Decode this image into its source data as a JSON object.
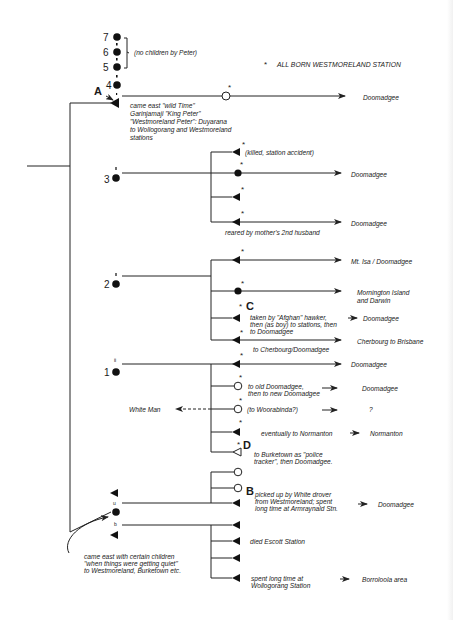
{
  "legend": {
    "symbol": "*",
    "text": "ALL BORN WESTMORELAND STATION"
  },
  "top_wives": {
    "numbers": [
      "7",
      "6",
      "5",
      "4"
    ],
    "bracket_note": "(no children  by Peter)"
  },
  "man_a": {
    "marker": "A",
    "note_lines": [
      "came east \"wild Time\"",
      "Garinjamaji  \"King Peter\"",
      "\"Westmoreland Peter\": Duyarana",
      "to Wollogorang and Westmoreland",
      "stations"
    ],
    "child": {
      "star": "*",
      "destination": "Doomadgee"
    }
  },
  "wife_3": {
    "number": "3",
    "children": [
      {
        "note": "(killed, station accident)",
        "star": "*"
      },
      {
        "destination": "Doomadgee",
        "star": "*"
      },
      {
        "star": "*"
      },
      {
        "destination": "Doomadgee",
        "star": "*",
        "note": "reared by mother's 2nd husband"
      }
    ]
  },
  "wife_2": {
    "number": "2",
    "children": [
      {
        "destination": "Mt. Isa / Doomadgee",
        "star": "*"
      },
      {
        "destination_lines": [
          "Mornington Island",
          "and Darwin"
        ],
        "star": "*"
      },
      {
        "marker": "C",
        "star": "*",
        "note_lines": [
          "taken by \"Afghan\" hawker,",
          "then (as boy) to stations, then",
          "to Doomadgee"
        ],
        "destination": "Doomadgee"
      },
      {
        "destination": "Cherbourg to Brisbane",
        "star": "*",
        "note": "to Cherbourg/Doomadgee"
      }
    ]
  },
  "wife_1": {
    "number": "1",
    "children": [
      {
        "destination": "Doomadgee",
        "star": "*"
      },
      {
        "note_lines": [
          "to old Doomadgee,",
          "then to new Doomadgee"
        ],
        "destination": "Doomadgee",
        "star": "*"
      },
      {
        "note": "(to Woorabinda?)",
        "destination": "?",
        "star": "*",
        "spouse": "White Man"
      },
      {
        "note": "eventually to Normanton",
        "destination": "Normanton",
        "star": "*"
      },
      {
        "marker": "D",
        "star": "*",
        "note_lines": [
          "to Burketown as \"police",
          "tracker\", then  Doomadgee."
        ]
      }
    ]
  },
  "last_wife": {
    "note_lines": [
      "came east with certain children",
      "\"when things were getting quiet\"",
      "to Westmoreland, Burketown etc."
    ],
    "husband_u_label": "u",
    "husband_b_label": "b",
    "children_u": [
      {},
      {
        "marker": "B",
        "note_lines": [
          "picked up by White drover",
          "from Westmoreland; spent",
          "long time at Armraynald Stn."
        ],
        "destination": "Doomadgee"
      }
    ],
    "children_b": [
      {},
      {
        "note": "died Escott Station"
      },
      {},
      {
        "note_lines": [
          "spent long time at",
          "Wollogorang Station"
        ],
        "destination": "Borroloola area"
      }
    ]
  },
  "spouse_marks": {
    "ii": "ii",
    "i": "i"
  },
  "colors": {
    "ink": "#1a1a1a",
    "paper": "#ffffff"
  }
}
